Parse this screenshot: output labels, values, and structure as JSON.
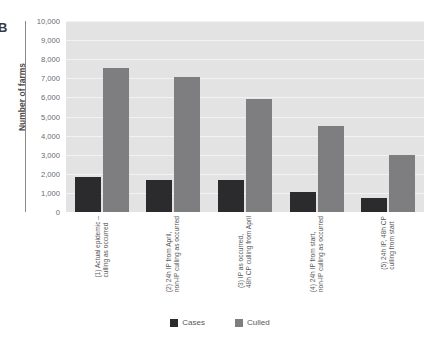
{
  "figure": {
    "panel_letter": "B"
  },
  "legend": {
    "position": "bottom-center",
    "items": [
      {
        "label": "Cases",
        "color": "#2b2b2d"
      },
      {
        "label": "Culled",
        "color": "#7e7e80"
      }
    ]
  },
  "chart_data": {
    "type": "bar",
    "title": "",
    "xlabel": "",
    "ylabel": "Number of farms",
    "ylim": [
      0,
      10000
    ],
    "ytick_labels": [
      "10,000",
      "9,000",
      "8,000",
      "7,000",
      "6,000",
      "5,000",
      "4,000",
      "3,000",
      "2,000",
      "1,000",
      "0"
    ],
    "ytick_values": [
      10000,
      9000,
      8000,
      7000,
      6000,
      5000,
      4000,
      3000,
      2000,
      1000,
      0
    ],
    "grid": true,
    "grid_axis": "y",
    "categories": [
      "(1) Actual epidemic – culling as occurred",
      "(2) 24h IP from April, non-IP culling as occurred",
      "(3) IP as occurred, 48h CP culling from April",
      "(4) 24h IP from start, non-IP culling as occurred",
      "(5) 24h IP, 48h CP culling from start"
    ],
    "category_lines": [
      [
        "(1) Actual epidemic –",
        "culling as occurred"
      ],
      [
        "(2) 24h IP from April,",
        "non-IP culling as occurred"
      ],
      [
        "(3) IP as occurred,",
        "48h CP culling from April"
      ],
      [
        "(4) 24h IP from start,",
        "non-IP culling as occurred"
      ],
      [
        "(5) 24h IP, 48h CP",
        "culling from start"
      ]
    ],
    "series": [
      {
        "name": "Cases",
        "color": "#2b2b2d",
        "values": [
          1850,
          1700,
          1700,
          1050,
          720
        ]
      },
      {
        "name": "Culled",
        "color": "#7e7e80",
        "values": [
          7550,
          7050,
          5900,
          4500,
          3000
        ]
      }
    ]
  }
}
